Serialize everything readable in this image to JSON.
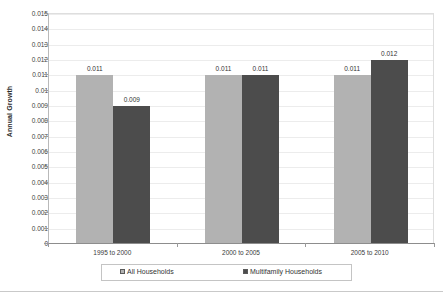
{
  "chart_data": {
    "type": "bar",
    "title": "",
    "subtitle": "",
    "xlabel": "",
    "ylabel": "Annual Growth",
    "categories": [
      "1995 to 2000",
      "2000 to 2005",
      "2005 to 2010"
    ],
    "series": [
      {
        "name": "All Households",
        "color": "#b2b2b2",
        "values": [
          0.011,
          0.011,
          0.011
        ],
        "labels": [
          "0.011",
          "0.011",
          "0.011"
        ]
      },
      {
        "name": "Multifamily Households",
        "color": "#4c4c4c",
        "values": [
          0.009,
          0.011,
          0.012
        ],
        "labels": [
          "0.009",
          "0.011",
          "0.012"
        ]
      }
    ],
    "ylim": [
      0,
      0.015
    ],
    "ytick_step": 0.001,
    "ytick_labels": [
      "0",
      "0.001",
      "0.002",
      "0.003",
      "0.004",
      "0.005",
      "0.006",
      "0.007",
      "0.008",
      "0.009",
      "0.01",
      "0.011",
      "0.012",
      "0.013",
      "0.014",
      "0.015"
    ],
    "grid": true,
    "legend_position": "bottom"
  },
  "legend": {
    "items": [
      {
        "label": "All Households",
        "swatch": "legend-swatch-light"
      },
      {
        "label": "Multifamily Households",
        "swatch": "legend-swatch-dark"
      }
    ]
  },
  "axis": {
    "y_title": "Annual Growth"
  }
}
